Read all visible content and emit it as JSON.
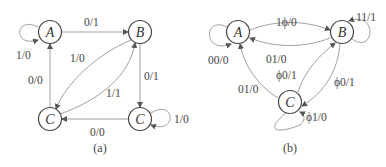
{
  "diagrams": [
    {
      "caption": "(a)",
      "states": [
        {
          "id": "A",
          "label": "A"
        },
        {
          "id": "B",
          "label": "B"
        },
        {
          "id": "C1",
          "label": "C"
        },
        {
          "id": "C2",
          "label": "C"
        }
      ],
      "transitions": [
        {
          "from": "A",
          "to": "A",
          "label": "1/0"
        },
        {
          "from": "A",
          "to": "B",
          "label": "0/1"
        },
        {
          "from": "B",
          "to": "C1",
          "label": "1/0"
        },
        {
          "from": "C1",
          "to": "B",
          "label": "1/1"
        },
        {
          "from": "C1",
          "to": "A",
          "label": "0/0"
        },
        {
          "from": "B",
          "to": "C2",
          "label": "0/1"
        },
        {
          "from": "C2",
          "to": "C2",
          "label": "1/0"
        },
        {
          "from": "C2",
          "to": "C1",
          "label": "0/0"
        }
      ]
    },
    {
      "caption": "(b)",
      "states": [
        {
          "id": "A",
          "label": "A"
        },
        {
          "id": "B",
          "label": "B"
        },
        {
          "id": "C",
          "label": "C"
        }
      ],
      "transitions": [
        {
          "from": "A",
          "to": "A",
          "label": "00/0"
        },
        {
          "from": "A",
          "to": "B",
          "label": "1ϕ/0"
        },
        {
          "from": "B",
          "to": "A",
          "label": "01/0"
        },
        {
          "from": "B",
          "to": "B",
          "label": "11/1"
        },
        {
          "from": "C",
          "to": "B",
          "label": "ϕ0/1"
        },
        {
          "from": "B",
          "to": "C",
          "label": "ϕ0/1"
        },
        {
          "from": "C",
          "to": "A",
          "label": "01/0"
        },
        {
          "from": "C",
          "to": "C",
          "label": "ϕ1/0"
        }
      ]
    }
  ]
}
